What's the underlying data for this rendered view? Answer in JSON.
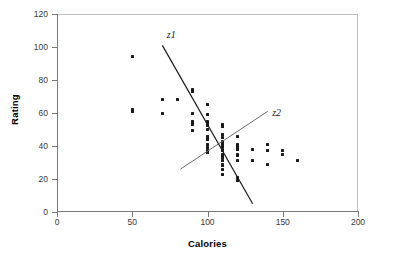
{
  "chart_data": {
    "type": "scatter",
    "title": "",
    "xlabel": "Calories",
    "ylabel": "Rating",
    "xlim": [
      0,
      200
    ],
    "ylim": [
      0,
      120
    ],
    "xticks": [
      0,
      50,
      100,
      150,
      200
    ],
    "yticks": [
      0,
      20,
      40,
      60,
      80,
      100,
      120
    ],
    "grid": false,
    "legend": "none",
    "series": [
      {
        "name": "cereals",
        "marker": "square",
        "color": "#1a1a1a",
        "points": [
          [
            50,
            94
          ],
          [
            50,
            62
          ],
          [
            50,
            61
          ],
          [
            70,
            68
          ],
          [
            70,
            59.5
          ],
          [
            80,
            68
          ],
          [
            90,
            74
          ],
          [
            90,
            73
          ],
          [
            90,
            60
          ],
          [
            90,
            55
          ],
          [
            90,
            54
          ],
          [
            90,
            53
          ],
          [
            90,
            49.5
          ],
          [
            100,
            65
          ],
          [
            100,
            59
          ],
          [
            100,
            55
          ],
          [
            100,
            54
          ],
          [
            100,
            53
          ],
          [
            100,
            52.5
          ],
          [
            100,
            50
          ],
          [
            100,
            46
          ],
          [
            100,
            45
          ],
          [
            100,
            44
          ],
          [
            100,
            41
          ],
          [
            100,
            39
          ],
          [
            100,
            37
          ],
          [
            100,
            36
          ],
          [
            110,
            53
          ],
          [
            110,
            52
          ],
          [
            110,
            47
          ],
          [
            110,
            45
          ],
          [
            110,
            43
          ],
          [
            110,
            42
          ],
          [
            110,
            41
          ],
          [
            110,
            40
          ],
          [
            110,
            38
          ],
          [
            110,
            37
          ],
          [
            110,
            35
          ],
          [
            110,
            34
          ],
          [
            110,
            33
          ],
          [
            110,
            31
          ],
          [
            110,
            29
          ],
          [
            110,
            28
          ],
          [
            110,
            26
          ],
          [
            110,
            23
          ],
          [
            120,
            46
          ],
          [
            120,
            41
          ],
          [
            120,
            40
          ],
          [
            120,
            39
          ],
          [
            120,
            38
          ],
          [
            120,
            35
          ],
          [
            120,
            34
          ],
          [
            120,
            31
          ],
          [
            120,
            21
          ],
          [
            120,
            19
          ],
          [
            130,
            38
          ],
          [
            130,
            31
          ],
          [
            140,
            41
          ],
          [
            140,
            37
          ],
          [
            140,
            29
          ],
          [
            150,
            37
          ],
          [
            150,
            35
          ],
          [
            160,
            31
          ]
        ]
      }
    ],
    "annotations": [
      {
        "name": "z1",
        "label": "z1",
        "type": "line",
        "color": "#1a1a1a",
        "width": 1.2,
        "x0": 70,
        "y0": 101,
        "x1": 130,
        "y1": 5,
        "label_x": 73,
        "label_y": 107
      },
      {
        "name": "z2",
        "label": "z2",
        "type": "line",
        "color": "#6b6b6b",
        "width": 1,
        "x0": 82,
        "y0": 26,
        "x1": 140,
        "y1": 61,
        "label_x": 143,
        "label_y": 60
      }
    ]
  },
  "axes": {
    "x_title": "Calories",
    "y_title": "Rating",
    "x_tick_labels": [
      "0",
      "50",
      "100",
      "150",
      "200"
    ],
    "y_tick_labels": [
      "0",
      "20",
      "40",
      "60",
      "80",
      "100",
      "120"
    ]
  },
  "labels": {
    "z1": "z1",
    "z2": "z2"
  }
}
